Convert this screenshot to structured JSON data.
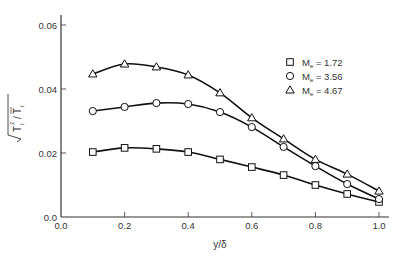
{
  "chart_data": {
    "type": "line",
    "title": "",
    "xlabel": "y/δ",
    "ylabel": "√(T̃t²)/T̄t",
    "xlim": [
      0.0,
      1.0
    ],
    "ylim": [
      0.0,
      0.06
    ],
    "x_ticks": [
      "0.0",
      "0.2",
      "0.4",
      "0.6",
      "0.8",
      "1.0"
    ],
    "y_ticks": [
      "0.0",
      "0.02",
      "0.04",
      "0.06"
    ],
    "grid": false,
    "legend_position": "upper right",
    "x": [
      0.1,
      0.2,
      0.3,
      0.4,
      0.5,
      0.6,
      0.7,
      0.8,
      0.9,
      1.0
    ],
    "series": [
      {
        "name": "Me = 1.72",
        "marker": "square",
        "values": [
          0.0203,
          0.0216,
          0.0213,
          0.0203,
          0.018,
          0.0156,
          0.0131,
          0.01,
          0.0072,
          0.0047
        ]
      },
      {
        "name": "Me = 3.56",
        "marker": "circle",
        "values": [
          0.0331,
          0.0344,
          0.0356,
          0.0353,
          0.0328,
          0.0281,
          0.0219,
          0.0159,
          0.0103,
          0.0056
        ]
      },
      {
        "name": "Me = 4.67",
        "marker": "triangle",
        "values": [
          0.0447,
          0.0478,
          0.0469,
          0.0444,
          0.0388,
          0.031,
          0.0244,
          0.018,
          0.0134,
          0.0081
        ]
      }
    ]
  },
  "legend": [
    {
      "symbol": "square",
      "label_prefix": "M",
      "label_sub": "e",
      "label_suffix": " = 1.72"
    },
    {
      "symbol": "circle",
      "label_prefix": "M",
      "label_sub": "e",
      "label_suffix": " = 3.56"
    },
    {
      "symbol": "triangle",
      "label_prefix": "M",
      "label_sub": "e",
      "label_suffix": " = 4.67"
    }
  ],
  "axes": {
    "xlabel": "y/δ",
    "ylabel_main": "T",
    "ylabel_sub": "t",
    "ylabel_den": "T",
    "ylabel_den_sub": "t"
  },
  "colors": {
    "line": "#111111",
    "axis": "#333333",
    "text": "#333333"
  }
}
